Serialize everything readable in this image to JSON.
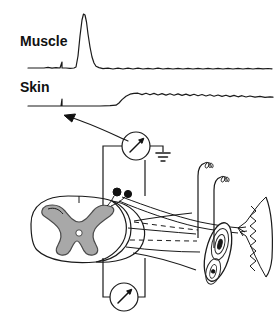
{
  "figure": {
    "background_color": "#ffffff",
    "ink_color": "#1a1a1a",
    "gray_matter_color": "#a8a8a8",
    "width": 276,
    "height": 327
  },
  "traces": {
    "muscle": {
      "label": "Muscle",
      "label_x": 20,
      "label_y": 45,
      "baseline_y": 68,
      "x_start": 28,
      "x_end": 272,
      "stimulus_tick_x": 62,
      "peak_x": 84,
      "peak_y": 14,
      "description": "flat baseline, small stimulus artifact tick, then large sharp positive deflection returning to baseline with low amplitude ripple"
    },
    "skin": {
      "label": "Skin",
      "label_x": 20,
      "label_y": 92,
      "baseline_y": 106,
      "x_start": 28,
      "x_end": 272,
      "stimulus_tick_x": 62,
      "rise_x": 118,
      "plateau_y": 94,
      "description": "flat baseline, stimulus tick, slow rising step to an oscillating plateau that slowly decays"
    }
  },
  "arrow": {
    "name": "pointer-arrow",
    "from_x": 128,
    "from_y": 140,
    "to_x": 64,
    "to_y": 116,
    "description": "curved arrow pointing from the upper recording electrode circuit to the skin trace stimulus artifact"
  },
  "instruments": {
    "upper_meter": {
      "name": "upper-meter",
      "cx": 136,
      "cy": 146,
      "r": 14,
      "needle_angle_deg": -45,
      "lead_left_x": 103,
      "lead_right_x": 163,
      "ground_x": 163,
      "ground_y": 146
    },
    "lower_meter": {
      "name": "lower-meter",
      "cx": 124,
      "cy": 297,
      "r": 14,
      "needle_angle_deg": -45,
      "lead_left_x": 103,
      "lead_right_x": 145,
      "top_y": 262
    }
  },
  "anatomy": {
    "spinal_cord": {
      "name": "spinal-cord-cross-section",
      "cx": 79,
      "cy": 230,
      "rx": 52,
      "ry": 33
    },
    "gray_matter": {
      "name": "gray-matter-butterfly",
      "fill": "#a8a8a8"
    },
    "central_canal": {
      "name": "central-canal",
      "cx": 79,
      "cy": 233,
      "r": 3.2,
      "fill": "#ffffff"
    },
    "synaptic_terminals": [
      {
        "name": "synaptic-bouton-1",
        "cx": 117,
        "cy": 192,
        "r": 4.0
      },
      {
        "name": "synaptic-bouton-2",
        "cx": 128,
        "cy": 194,
        "r": 3.6
      }
    ],
    "muscle_spindle": {
      "name": "muscle-spindle",
      "cx": 218,
      "cy": 252,
      "rx": 12,
      "ry": 30,
      "rotation_deg": 15
    },
    "muscle_belly": {
      "name": "skeletal-muscle",
      "x": 248,
      "y_top": 196,
      "y_bottom": 276
    },
    "sensory_endings": [
      {
        "name": "sensory-coil-ending-1",
        "x": 198,
        "y_top": 162,
        "y_bottom": 232
      },
      {
        "name": "sensory-coil-ending-2",
        "x": 214,
        "y_top": 176,
        "y_bottom": 240
      }
    ],
    "motor_axon": {
      "name": "motor-axon",
      "description": "axon leaving the ventral horn, running right to the muscle end plate"
    },
    "sensory_axon": {
      "name": "sensory-axon",
      "description": "dorsal root afferent fibres entering the cord at the synaptic boutons"
    }
  }
}
